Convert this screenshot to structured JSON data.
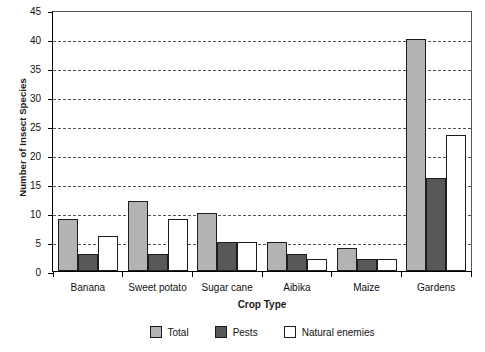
{
  "chart_data": {
    "type": "bar",
    "title": "",
    "xlabel": "Crop Type",
    "ylabel": "Number of Insect Species",
    "ylim": [
      0,
      45
    ],
    "ytick_step": 5,
    "yticks": [
      "45",
      "40",
      "35",
      "30",
      "25",
      "20",
      "15",
      "10",
      "5",
      "0"
    ],
    "grid": "horizontal-dashed",
    "legend_position": "bottom-center",
    "categories": [
      "Banana",
      "Sweet potato",
      "Sugar cane",
      "Aibika",
      "Maize",
      "Gardens"
    ],
    "series": [
      {
        "name": "Total",
        "color": "#b3b3b3",
        "values": [
          9,
          12,
          10,
          5,
          4,
          40
        ]
      },
      {
        "name": "Pests",
        "color": "#585858",
        "values": [
          3,
          3,
          5,
          3,
          2,
          16
        ]
      },
      {
        "name": "Natural enemies",
        "color": "#ffffff",
        "values": [
          6,
          9,
          5,
          2,
          2,
          23.5
        ]
      }
    ]
  },
  "legend": {
    "items": [
      {
        "label": "Total"
      },
      {
        "label": "Pests"
      },
      {
        "label": "Natural enemies"
      }
    ]
  },
  "colors": {
    "total": "#b3b3b3",
    "pests": "#585858",
    "natural_enemies": "#ffffff",
    "axis": "#000000",
    "gridline": "#555555"
  }
}
